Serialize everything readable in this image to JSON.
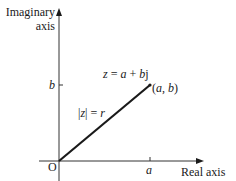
{
  "diagram": {
    "type": "argand-diagram",
    "axes": {
      "vertical_label_line1": "Imaginary",
      "vertical_label_line2": "axis",
      "horizontal_label": "Real axis",
      "origin_label": "O"
    },
    "ticks": {
      "x_tick_label": "a",
      "y_tick_label": "b"
    },
    "vector": {
      "equation_lhs": "z",
      "equation_eq": " = ",
      "equation_a": "a",
      "equation_plus": " + ",
      "equation_b": "b",
      "equation_j": "j",
      "point_label_open": "(",
      "point_label_a": "a",
      "point_label_comma": ", ",
      "point_label_b": "b",
      "point_label_close": ")",
      "modulus_label_bar_open": "|",
      "modulus_label_z": "z",
      "modulus_label_bar_close": "|",
      "modulus_label_eq": " = ",
      "modulus_label_r": "r"
    },
    "colors": {
      "line": "#1a1a1a",
      "axis": "#333333",
      "background": "#ffffff"
    }
  }
}
